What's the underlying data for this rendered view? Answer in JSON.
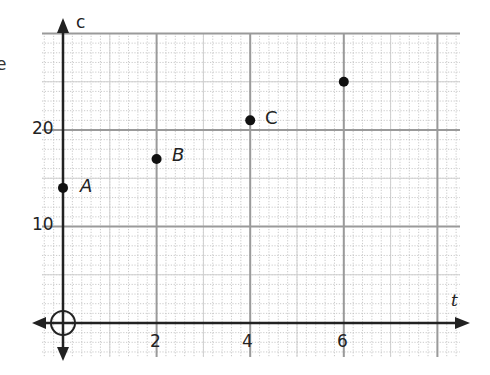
{
  "chart_data": {
    "type": "scatter",
    "title": "",
    "xlabel": "t",
    "ylabel": "c",
    "x_ticks": [
      2,
      4,
      6
    ],
    "y_ticks": [
      10,
      20
    ],
    "xlim": [
      -0.45,
      8.5
    ],
    "ylim": [
      -3.5,
      30
    ],
    "grid": true,
    "minor_grid": {
      "x_step": 0.2,
      "y_step": 1
    },
    "major_grid": {
      "x_step": 2,
      "y_step": 10
    },
    "points": [
      {
        "label": "A",
        "t": 0,
        "c": 14
      },
      {
        "label": "B",
        "t": 2,
        "c": 17
      },
      {
        "label": "C",
        "t": 4,
        "c": 21
      },
      {
        "label": "",
        "t": 6,
        "c": 25
      }
    ],
    "origin_marker": "circle"
  },
  "labels": {
    "x_axis": "t",
    "y_axis": "c",
    "x_tick_2": "2",
    "x_tick_4": "4",
    "x_tick_6": "6",
    "y_tick_10": "10",
    "y_tick_20": "20",
    "point_a": "A",
    "point_b": "B",
    "point_c": "C",
    "edge_fragment": "e"
  }
}
